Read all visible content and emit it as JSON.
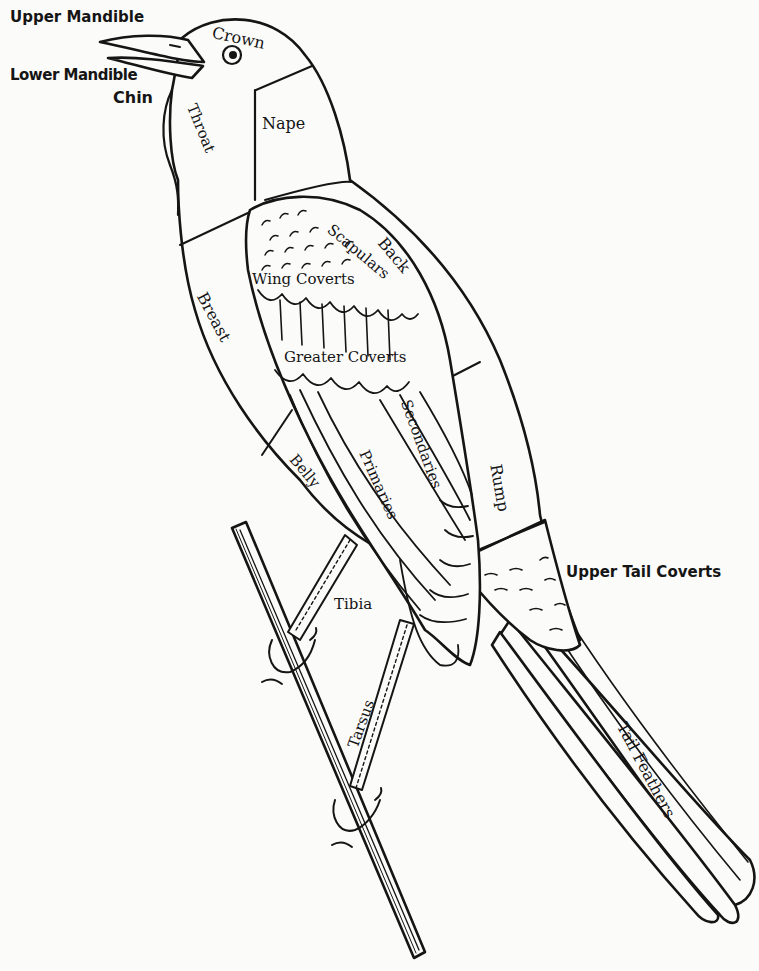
{
  "diagram": {
    "type": "bird-anatomy",
    "labels": {
      "upper_mandible": "Upper Mandible",
      "lower_mandible": "Lower Mandible",
      "chin": "Chin",
      "crown": "Crown",
      "throat": "Throat",
      "nape": "Nape",
      "back": "Back",
      "scapulars": "Scapulars",
      "wing_coverts": "Wing Coverts",
      "breast": "Breast",
      "greater_coverts": "Greater Coverts",
      "secondaries": "Secondaries",
      "belly": "Belly",
      "primaries": "Primaries",
      "rump": "Rump",
      "upper_tail_coverts": "Upper Tail Coverts",
      "tibia": "Tibia",
      "tarsus": "Tarsus",
      "tail_feathers": "Tail Feathers"
    },
    "colors": {
      "ink": "#151515",
      "paper": "#fbfbfa"
    }
  }
}
